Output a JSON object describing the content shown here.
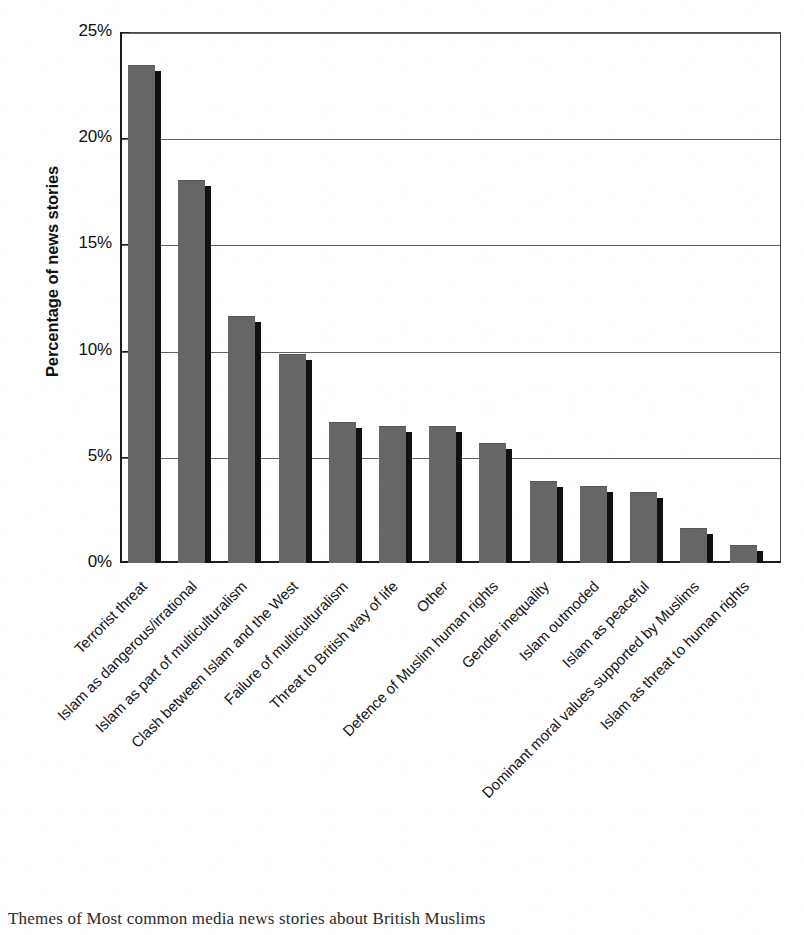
{
  "chart_data": {
    "type": "bar",
    "title": "",
    "xlabel": "",
    "ylabel": "Percentage of news stories",
    "ylim": [
      0,
      25
    ],
    "yticks": [
      0,
      5,
      10,
      15,
      20,
      25
    ],
    "ytick_labels": [
      "0%",
      "5%",
      "10%",
      "15%",
      "20%",
      "25%"
    ],
    "grid": "horizontal",
    "legend": "none",
    "categories": [
      "Terrorist threat",
      "Islam as dangerous/irrational",
      "Islam as part of multiculturalism",
      "Clash between Islam and the West",
      "Failure of multiculturalism",
      "Threat to British way of life",
      "Other",
      "Defence of Muslim human rights",
      "Gender inequality",
      "Islam outmoded",
      "Islam as peaceful",
      "Dominant moral values supported by Muslims",
      "Islam as threat to human rights"
    ],
    "values": [
      23.4,
      18.0,
      11.6,
      9.8,
      6.6,
      6.4,
      6.4,
      5.6,
      3.8,
      3.6,
      3.3,
      1.6,
      0.8
    ]
  },
  "caption": {
    "text": "Themes of Most common media news stories about British Muslims"
  },
  "bar_style": {
    "fill": "#666666",
    "shadow": "#111111"
  }
}
